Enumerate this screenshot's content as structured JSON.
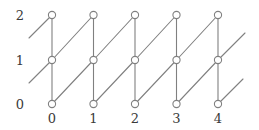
{
  "figure": {
    "type": "lattice-graph-diagram",
    "width": 259,
    "height": 130,
    "background_color": "#ffffff"
  },
  "style": {
    "edge_color": "#808080",
    "edge_width": 1.1,
    "node_stroke_color": "#808080",
    "node_fill_color": "#ffffff",
    "node_radius": 3.6,
    "node_stroke_width": 1.1,
    "label_color": "#3a3a3a",
    "label_font_size": 13
  },
  "axes": {
    "x_labels": [
      "0",
      "1",
      "2",
      "3",
      "4"
    ],
    "x_positions": [
      52,
      93.5,
      135,
      176.5,
      218
    ],
    "x_label_y": 112,
    "y_labels": [
      "2",
      "1",
      "0"
    ],
    "y_values": [
      2,
      1,
      0
    ],
    "y_positions": [
      15,
      60,
      104
    ],
    "y_label_x": 24
  },
  "chart_data": {
    "type": "scatter",
    "title": "",
    "xlabel": "",
    "ylabel": "",
    "x_tick_labels": [
      "0",
      "1",
      "2",
      "3",
      "4"
    ],
    "y_tick_labels": [
      "0",
      "1",
      "2"
    ],
    "xlim": [
      0,
      4
    ],
    "ylim": [
      0,
      2
    ],
    "grid": false,
    "legend": null,
    "nodes": [
      {
        "x": 0,
        "y": 0
      },
      {
        "x": 0,
        "y": 1
      },
      {
        "x": 0,
        "y": 2
      },
      {
        "x": 1,
        "y": 0
      },
      {
        "x": 1,
        "y": 1
      },
      {
        "x": 1,
        "y": 2
      },
      {
        "x": 2,
        "y": 0
      },
      {
        "x": 2,
        "y": 1
      },
      {
        "x": 2,
        "y": 2
      },
      {
        "x": 3,
        "y": 0
      },
      {
        "x": 3,
        "y": 1
      },
      {
        "x": 3,
        "y": 2
      },
      {
        "x": 4,
        "y": 0
      },
      {
        "x": 4,
        "y": 1
      },
      {
        "x": 4,
        "y": 2
      }
    ],
    "vertical_edges": [
      {
        "x": 0,
        "from_y": 0,
        "to_y": 1
      },
      {
        "x": 0,
        "from_y": 1,
        "to_y": 2
      },
      {
        "x": 1,
        "from_y": 0,
        "to_y": 1
      },
      {
        "x": 1,
        "from_y": 1,
        "to_y": 2
      },
      {
        "x": 2,
        "from_y": 0,
        "to_y": 1
      },
      {
        "x": 2,
        "from_y": 1,
        "to_y": 2
      },
      {
        "x": 3,
        "from_y": 0,
        "to_y": 1
      },
      {
        "x": 3,
        "from_y": 1,
        "to_y": 2
      },
      {
        "x": 4,
        "from_y": 0,
        "to_y": 1
      },
      {
        "x": 4,
        "from_y": 1,
        "to_y": 2
      }
    ],
    "diagonal_edges": [
      {
        "from_x": 0,
        "from_y": 0,
        "to_x": 1,
        "to_y": 1
      },
      {
        "from_x": 0,
        "from_y": 1,
        "to_x": 1,
        "to_y": 2
      },
      {
        "from_x": 1,
        "from_y": 0,
        "to_x": 2,
        "to_y": 1
      },
      {
        "from_x": 1,
        "from_y": 1,
        "to_x": 2,
        "to_y": 2
      },
      {
        "from_x": 2,
        "from_y": 0,
        "to_x": 3,
        "to_y": 1
      },
      {
        "from_x": 2,
        "from_y": 1,
        "to_x": 3,
        "to_y": 2
      },
      {
        "from_x": 3,
        "from_y": 0,
        "to_x": 4,
        "to_y": 1
      },
      {
        "from_x": 3,
        "from_y": 1,
        "to_x": 4,
        "to_y": 2
      }
    ],
    "stub_edges": [
      {
        "px1": 29,
        "py1": 38,
        "px2": 52,
        "py2": 15
      },
      {
        "px1": 29,
        "py1": 83,
        "px2": 52,
        "py2": 60
      },
      {
        "px1": 218,
        "py1": 60,
        "px2": 245,
        "py2": 33
      },
      {
        "px1": 218,
        "py1": 104,
        "px2": 243,
        "py2": 79
      }
    ]
  }
}
